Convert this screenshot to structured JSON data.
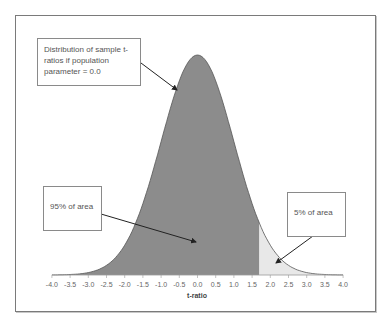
{
  "chart_data": {
    "type": "area",
    "title": "",
    "xlabel": "t-ratio",
    "ylabel": "",
    "xlim": [
      -4.0,
      4.0
    ],
    "grid": false,
    "legend": "none",
    "x_ticks": [
      "-4.0",
      "-3.5",
      "-3.0",
      "-2.5",
      "-2.0",
      "-1.5",
      "-1.0",
      "-0.5",
      "0.0",
      "0.5",
      "1.0",
      "1.5",
      "2.0",
      "2.5",
      "3.0",
      "3.5",
      "4.0"
    ],
    "series": [
      {
        "name": "t-distribution density (population parameter = 0.0)",
        "function": "t pdf",
        "peak_x": 0.0
      },
      {
        "name": "95% of area",
        "region": [
          -4.0,
          1.7
        ],
        "color": "#8c8c8c"
      },
      {
        "name": "5% of area",
        "region": [
          1.7,
          4.0
        ],
        "color": "#e8e8e8"
      }
    ],
    "critical_value": 1.7,
    "annotations": [
      {
        "text": "Distribution of sample t-ratios if population parameter = 0.0",
        "points_to": "curve"
      },
      {
        "text": "95% of area",
        "points_to": "dark region"
      },
      {
        "text": "5% of area",
        "points_to": "upper tail"
      }
    ]
  },
  "annotations": {
    "distribution": "Distribution of sample t-ratios if population parameter = 0.0",
    "area95": "95% of area",
    "area5": "5% of area"
  },
  "axis": {
    "xlabel": "t-ratio"
  },
  "colors": {
    "dark_fill": "#8c8c8c",
    "light_fill": "#e8e8e8",
    "curve": "#555555"
  }
}
